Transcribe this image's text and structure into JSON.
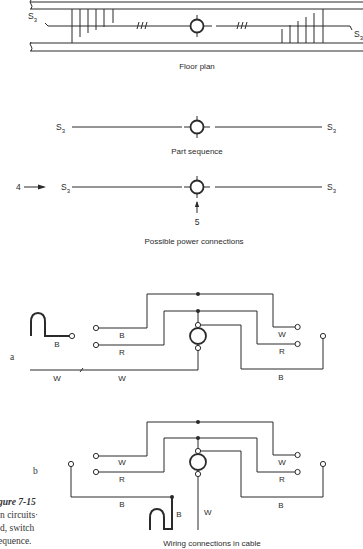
{
  "figure": {
    "number_label": "gure 7-15",
    "caption_lines": [
      "n circuits·",
      "d, switch",
      "equence."
    ]
  },
  "floor_plan": {
    "caption": "Floor plan",
    "switch_left": "S",
    "switch_left_sub": "3",
    "switch_right": "S",
    "switch_right_sub": "3"
  },
  "part_sequence": {
    "caption": "Part sequence",
    "switch_left": "S",
    "switch_left_sub": "3",
    "switch_right": "S",
    "switch_right_sub": "3"
  },
  "power_connections": {
    "caption": "Possible power connections",
    "switch_left": "S",
    "switch_left_sub": "3",
    "switch_right": "S",
    "switch_right_sub": "3",
    "arrow_left_label": "4",
    "arrow_bottom_label": "5"
  },
  "wiring_a": {
    "label": "a",
    "wires": {
      "source_b": "B",
      "switch1_top": "B",
      "switch1_bottom": "R",
      "neutral_left": "W",
      "neutral_mid": "W",
      "switch2_top": "W",
      "switch2_bottom": "R",
      "return_b": "B"
    }
  },
  "wiring_b": {
    "label": "b",
    "caption": "Wiring connections in cable",
    "wires": {
      "switch1_top": "W",
      "switch1_bottom": "R",
      "left_b": "B",
      "source_b": "B",
      "fixture_w": "W",
      "switch2_top": "W",
      "switch2_bottom": "R",
      "return_b": "B"
    }
  },
  "colors": {
    "ink": "#2a2a2a",
    "paper": "#ffffff"
  }
}
